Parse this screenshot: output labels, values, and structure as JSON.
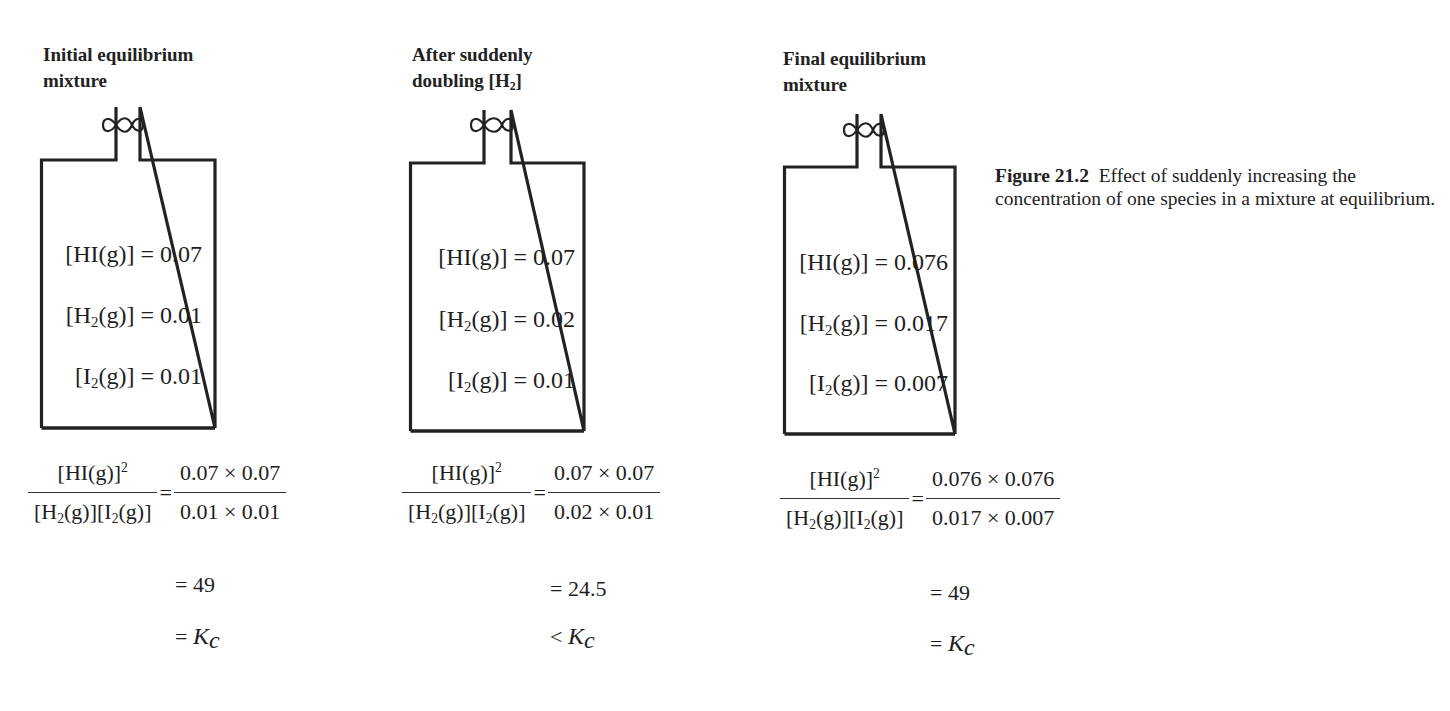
{
  "figure": {
    "number": "Figure 21.2",
    "caption": "Effect of suddenly increasing the concentration of one species in a mixture at equilibrium."
  },
  "panels": [
    {
      "title_line1": "Initial equilibrium",
      "title_line2": "mixture",
      "concentrations": {
        "HI": "0.07",
        "H2": "0.01",
        "I2": "0.01"
      },
      "expression": {
        "numerator_label": "[HI(g)]",
        "numerator_power": "2",
        "denominator_label_h2": "[H",
        "denominator_label_i2": "[I",
        "equals": "=",
        "numerator_values": "0.07 × 0.07",
        "denominator_values": "0.01 × 0.01"
      },
      "result_line": "= 49",
      "comparison_symbol": "=",
      "comparison_target": "K",
      "comparison_sub": "c"
    },
    {
      "title_line1": "After suddenly",
      "title_line2": "doubling [H",
      "title_line2_sub": "2",
      "title_line2_end": "]",
      "concentrations": {
        "HI": "0.07",
        "H2": "0.02",
        "I2": "0.01"
      },
      "expression": {
        "numerator_label": "[HI(g)]",
        "numerator_power": "2",
        "denominator_label_h2": "[H",
        "denominator_label_i2": "[I",
        "equals": "=",
        "numerator_values": "0.07 × 0.07",
        "denominator_values": "0.02 × 0.01"
      },
      "result_line": "= 24.5",
      "comparison_symbol": "<",
      "comparison_target": "K",
      "comparison_sub": "c"
    },
    {
      "title_line1": "Final equilibrium",
      "title_line2": "mixture",
      "concentrations": {
        "HI": "0.076",
        "H2": "0.017",
        "I2": "0.007"
      },
      "expression": {
        "numerator_label": "[HI(g)]",
        "numerator_power": "2",
        "denominator_label_h2": "[H",
        "denominator_label_i2": "[I",
        "equals": "=",
        "numerator_values": "0.076 × 0.076",
        "denominator_values": "0.017 × 0.007"
      },
      "result_line": "= 49",
      "comparison_symbol": "=",
      "comparison_target": "K",
      "comparison_sub": "c"
    }
  ],
  "labels": {
    "HI_prefix": "[HI(g)] = ",
    "H2_prefix_a": "[H",
    "H2_sub": "2",
    "H2_prefix_b": "(g)] = ",
    "I2_prefix_a": "[I",
    "I2_sub": "2",
    "I2_prefix_b": "(g)] = ",
    "g_close": "(g)]"
  },
  "colors": {
    "ink": "#1e1e1e",
    "background": "#ffffff"
  }
}
